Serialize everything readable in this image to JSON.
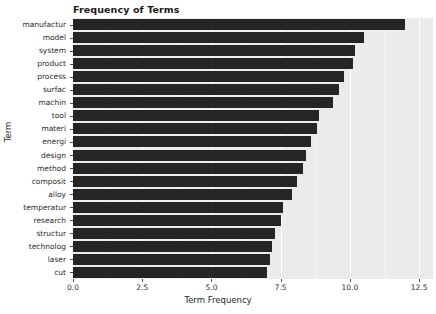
{
  "chart_data": {
    "type": "bar",
    "orientation": "horizontal",
    "title": "Frequency of Terms",
    "xlabel": "Term Frequency",
    "ylabel": "Term",
    "categories": [
      "manufactur",
      "model",
      "system",
      "product",
      "process",
      "surfac",
      "machin",
      "tool",
      "materi",
      "energi",
      "design",
      "method",
      "composit",
      "alloy",
      "temperatur",
      "research",
      "structur",
      "technolog",
      "laser",
      "cut"
    ],
    "values": [
      12.0,
      10.5,
      10.2,
      10.1,
      9.8,
      9.6,
      9.4,
      8.9,
      8.8,
      8.6,
      8.4,
      8.3,
      8.1,
      7.9,
      7.6,
      7.5,
      7.3,
      7.2,
      7.1,
      7.0
    ],
    "xlim": [
      0,
      13.0
    ],
    "xticks": [
      "0.0",
      "2.5",
      "5.0",
      "7.5",
      "10.0",
      "12.5"
    ],
    "xtick_values": [
      0,
      2.5,
      5.0,
      7.5,
      10.0,
      12.5
    ],
    "grid": true,
    "legend": null,
    "bar_color": "#252525",
    "panel_color": "#ebebeb",
    "grid_color": "#ffffff"
  }
}
